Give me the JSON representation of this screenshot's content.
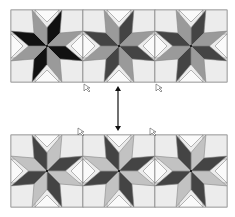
{
  "figure": {
    "width": 235,
    "height": 217,
    "block_size": 72,
    "colors": {
      "background": "#ffffff",
      "square_light": "#ececec",
      "triangle_white": "#fafafa",
      "outline": "#888888",
      "black": "#111111",
      "dark_gray": "#444444",
      "mid_gray": "#9a9a9a",
      "light_gray": "#c2c2c2",
      "arrow": "#111111"
    },
    "strips": [
      {
        "name": "top-strip",
        "x": 11,
        "y": 10,
        "blocks": [
          {
            "dark": "black",
            "light": "mid_gray",
            "dark_first": true
          },
          {
            "dark": "dark_gray",
            "light": "mid_gray",
            "dark_first": true
          },
          {
            "dark": "dark_gray",
            "light": "mid_gray",
            "dark_first": true
          }
        ],
        "cursor_marks": [
          {
            "x": 84,
            "y": 84
          },
          {
            "x": 156,
            "y": 84
          }
        ]
      },
      {
        "name": "bottom-strip",
        "x": 11,
        "y": 135,
        "blocks": [
          {
            "dark": "dark_gray",
            "light": "light_gray",
            "dark_first": false
          },
          {
            "dark": "dark_gray",
            "light": "light_gray",
            "dark_first": false
          },
          {
            "dark": "dark_gray",
            "light": "light_gray",
            "dark_first": false
          }
        ],
        "cursor_marks": [
          {
            "x": 78,
            "y": 128
          },
          {
            "x": 150,
            "y": 128
          }
        ]
      }
    ],
    "arrow": {
      "x": 118,
      "y1": 86,
      "y2": 131,
      "type": "double-headed-vertical"
    }
  }
}
